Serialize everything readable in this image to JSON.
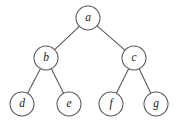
{
  "figure": {
    "background_color": "#ffffff",
    "node_stroke_color": "#555555",
    "node_fill_color": "#ffffff",
    "edge_color": "#5a5a5a",
    "label_color": "#1b1b1b",
    "node_radius": 12
  },
  "nodes": [
    {
      "id": "a",
      "label": "a",
      "cx": 88,
      "cy": 18,
      "level": 0
    },
    {
      "id": "b",
      "label": "b",
      "cx": 46,
      "cy": 58,
      "level": 1
    },
    {
      "id": "c",
      "label": "c",
      "cx": 134,
      "cy": 58,
      "level": 1
    },
    {
      "id": "d",
      "label": "d",
      "cx": 22,
      "cy": 104,
      "level": 2
    },
    {
      "id": "e",
      "label": "e",
      "cx": 69,
      "cy": 104,
      "level": 2
    },
    {
      "id": "f",
      "label": "f",
      "cx": 111,
      "cy": 104,
      "level": 2
    },
    {
      "id": "g",
      "label": "g",
      "cx": 156,
      "cy": 104,
      "level": 2
    }
  ],
  "edges": [
    {
      "from": "a",
      "to": "b"
    },
    {
      "from": "a",
      "to": "c"
    },
    {
      "from": "b",
      "to": "d"
    },
    {
      "from": "b",
      "to": "e"
    },
    {
      "from": "c",
      "to": "f"
    },
    {
      "from": "c",
      "to": "g"
    }
  ]
}
